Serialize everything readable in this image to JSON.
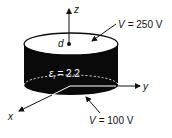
{
  "diagram": {
    "type": "cylindrical capacitor / disk with coordinate axes",
    "axes": {
      "x_label": "x",
      "y_label": "y",
      "z_label": "z"
    },
    "point_label": "d",
    "top_voltage": {
      "symbol": "V",
      "text": "= 250 V"
    },
    "bottom_voltage": {
      "symbol": "V",
      "text": "= 100 V"
    },
    "permittivity": {
      "symbol": "ε",
      "subscript": "r",
      "text": "= 2.2"
    },
    "colors": {
      "body": "#0a0a0a",
      "top_face": "#ffffff",
      "lines": "#111111"
    }
  }
}
